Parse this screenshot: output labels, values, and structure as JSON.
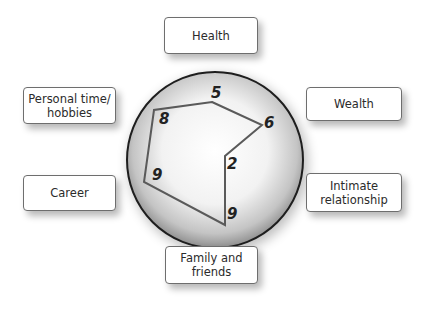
{
  "diagram": {
    "type": "wheel-of-life",
    "categories": [
      {
        "id": "health",
        "label": "Health",
        "score": "5"
      },
      {
        "id": "wealth",
        "label": "Wealth",
        "score": "6"
      },
      {
        "id": "intimate",
        "label": "Intimate\nrelationship",
        "score": "2"
      },
      {
        "id": "family",
        "label": "Family and\nfriends",
        "score": "9"
      },
      {
        "id": "career",
        "label": "Career",
        "score": "9"
      },
      {
        "id": "personal",
        "label": "Personal time/\nhobbies",
        "score": "8"
      }
    ],
    "colors": {
      "circle_edge": "#1e1e1e",
      "circle_fill_center": "#ffffff",
      "circle_fill_edge": "#9a9a9a",
      "polygon_stroke": "#5a5a5a",
      "box_border": "#6e6e6e"
    }
  }
}
